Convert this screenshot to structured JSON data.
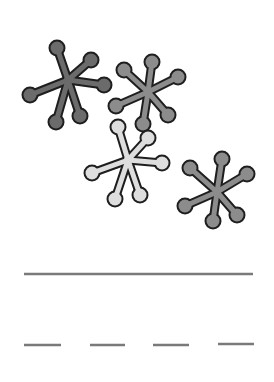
{
  "worksheet": {
    "picture": {
      "subject": "jacks",
      "count": 4,
      "jacks": [
        {
          "name": "jack-dark",
          "fill": "#6b6b6b",
          "center": [
            68,
            80
          ],
          "balls": [
            [
              57,
              48
            ],
            [
              91,
              60
            ],
            [
              104,
              85
            ],
            [
              30,
              95
            ],
            [
              56,
              122
            ],
            [
              80,
              116
            ]
          ]
        },
        {
          "name": "jack-medium-1",
          "fill": "#8c8c8c",
          "center": [
            148,
            92
          ],
          "balls": [
            [
              152,
              62
            ],
            [
              124,
              70
            ],
            [
              178,
              77
            ],
            [
              116,
              106
            ],
            [
              143,
              124
            ],
            [
              168,
              115
            ]
          ]
        },
        {
          "name": "jack-light",
          "fill": "#dedede",
          "center": [
            128,
            160
          ],
          "balls": [
            [
              118,
              127
            ],
            [
              148,
              138
            ],
            [
              162,
              163
            ],
            [
              92,
              173
            ],
            [
              115,
              199
            ],
            [
              140,
              195
            ]
          ]
        },
        {
          "name": "jack-medium-2",
          "fill": "#8c8c8c",
          "center": [
            217,
            192
          ],
          "balls": [
            [
              222,
              159
            ],
            [
              190,
              168
            ],
            [
              247,
              174
            ],
            [
              185,
              206
            ],
            [
              213,
              221
            ],
            [
              237,
              215
            ]
          ]
        }
      ],
      "outline_color": "#1e1e1e"
    },
    "answer_line": {
      "x1": 24,
      "x2": 253,
      "y": 274,
      "color": "#7a7a7a"
    },
    "dash_blanks": [
      {
        "x1": 24,
        "x2": 61,
        "y": 345
      },
      {
        "x1": 90,
        "x2": 125,
        "y": 345
      },
      {
        "x1": 153,
        "x2": 189,
        "y": 345
      },
      {
        "x1": 218,
        "x2": 254,
        "y": 344
      }
    ]
  }
}
